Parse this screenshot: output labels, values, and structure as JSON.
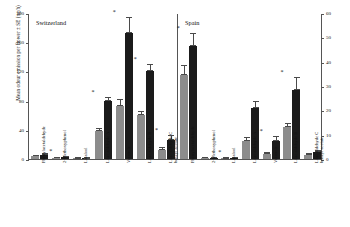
{
  "chart_data": {
    "type": "bar",
    "title": "",
    "ylabel": "Mean odour emission per flower ± SE (ng/h)",
    "xlabel": "",
    "ylim": [
      0,
      200
    ],
    "y_ticks": [
      0,
      40,
      80,
      120,
      160,
      200
    ],
    "y2lim": [
      0,
      60
    ],
    "y2_ticks": [
      0,
      10,
      20,
      30,
      40,
      50,
      60
    ],
    "grid": false,
    "legend": "none",
    "panels": [
      {
        "name": "Switzerland",
        "categories": [
          "Phenylacetaldehyde",
          "2-Methoxyphenol",
          "Linalool",
          "Lilac aldehyde A",
          "Veratrole",
          "Lilac aldehyde B",
          "Lilac aldehyde C / benzyl acetate"
        ],
        "series": [
          {
            "name": "gray",
            "values": [
              4.0,
              1.5,
              0.8,
              38.0,
              72.0,
              60.0,
              13.0
            ],
            "errors": [
              1.5,
              0.8,
              0.5,
              4.0,
              10.0,
              6.0,
              3.0
            ]
          },
          {
            "name": "black",
            "values": [
              6.0,
              2.5,
              1.0,
              80.0,
              172.0,
              121.0,
              26.0
            ],
            "errors": [
              2.0,
              1.0,
              0.6,
              5.0,
              22.0,
              9.0,
              7.0
            ]
          }
        ],
        "significance": [
          false,
          true,
          false,
          true,
          true,
          true,
          true
        ]
      },
      {
        "name": "Spain",
        "categories": [
          "Phenylacetaldehyde",
          "2-Methoxyphenol",
          "Linalool",
          "Lilac aldehyde A",
          "Veratrole",
          "Lilac aldehyde B",
          "Lilac aldehyde C / benzyl acetate"
        ],
        "series": [
          {
            "name": "gray",
            "values": [
              115.0,
              1.5,
              1.0,
              25.0,
              7.0,
              44.0,
              6.0
            ],
            "errors": [
              14.0,
              0.8,
              0.6,
              5.0,
              3.0,
              6.0,
              2.0
            ]
          },
          {
            "name": "black",
            "values": [
              155.0,
              2.0,
              1.5,
              70.0,
              24.0,
              94.0,
              9.0
            ],
            "errors": [
              17.0,
              1.0,
              0.8,
              10.0,
              8.0,
              18.0,
              3.0
            ]
          }
        ],
        "significance": [
          true,
          false,
          true,
          false,
          true,
          true,
          false
        ]
      }
    ]
  }
}
